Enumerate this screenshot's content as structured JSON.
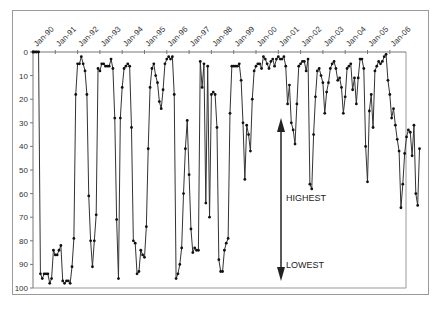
{
  "chart_data": {
    "type": "line",
    "title": "",
    "xlabel": "",
    "ylabel": "",
    "ylim": [
      0,
      100
    ],
    "y_inverted": true,
    "y_ticks": [
      0,
      10,
      20,
      30,
      40,
      50,
      60,
      70,
      80,
      90,
      100
    ],
    "x_tick_labels": [
      "Jan-90",
      "Jan-91",
      "Jan-92",
      "Jan-93",
      "Jan-94",
      "Jan-95",
      "Jan-96",
      "Jan-97",
      "Jan-98",
      "Jan-99",
      "Jan-00",
      "Jan-01",
      "Jan-02",
      "Jan-03",
      "Jan-04",
      "Jan-05",
      "Jan-06"
    ],
    "grid": false,
    "legend": null,
    "annotations": [
      {
        "text": "HIGHEST",
        "position": "upper"
      },
      {
        "text": "LOWEST",
        "position": "lower"
      },
      {
        "shape": "double-headed vertical arrow",
        "meaning": "highest at top, lowest at bottom"
      }
    ],
    "series": [
      {
        "name": "rank",
        "start": "Jan-90",
        "frequency": "monthly",
        "values": [
          0,
          0,
          0,
          0,
          94,
          96,
          94,
          94,
          94,
          98,
          96,
          84,
          86,
          86,
          84,
          82,
          97,
          98,
          97,
          97,
          98,
          91,
          79,
          18,
          5,
          5,
          2,
          5,
          8,
          18,
          61,
          80,
          91,
          80,
          69,
          7,
          8,
          5,
          5,
          6,
          6,
          6,
          3,
          7,
          28,
          71,
          96,
          28,
          15,
          7,
          6,
          5,
          6,
          32,
          80,
          81,
          94,
          93,
          84,
          86,
          87,
          74,
          41,
          15,
          7,
          5,
          10,
          13,
          21,
          24,
          16,
          5,
          3,
          2,
          3,
          2,
          18,
          96,
          94,
          90,
          83,
          60,
          41,
          29,
          52,
          75,
          85,
          83,
          84,
          84,
          4,
          15,
          5,
          64,
          6,
          70,
          18,
          17,
          18,
          32,
          88,
          93,
          93,
          84,
          81,
          79,
          26,
          6,
          6,
          6,
          6,
          5,
          12,
          30,
          54,
          31,
          35,
          42,
          20,
          8,
          6,
          5,
          5,
          7,
          2,
          3,
          5,
          7,
          4,
          3,
          6,
          3,
          2,
          3,
          3,
          2,
          6,
          22,
          14,
          30,
          33,
          39,
          22,
          6,
          5,
          4,
          4,
          8,
          3,
          56,
          58,
          35,
          19,
          8,
          7,
          10,
          13,
          26,
          17,
          13,
          7,
          5,
          4,
          7,
          12,
          11,
          15,
          26,
          19,
          7,
          6,
          5,
          16,
          11,
          22,
          11,
          3,
          3,
          7,
          40,
          55,
          25,
          18,
          32,
          8,
          6,
          4,
          5,
          4,
          2,
          1,
          12,
          18,
          28,
          24,
          31,
          37,
          42,
          66,
          56,
          43,
          36,
          33,
          34,
          44,
          31,
          60,
          65,
          41
        ]
      }
    ]
  },
  "annotations": {
    "highest_label": "HIGHEST",
    "lowest_label": "LOWEST"
  }
}
